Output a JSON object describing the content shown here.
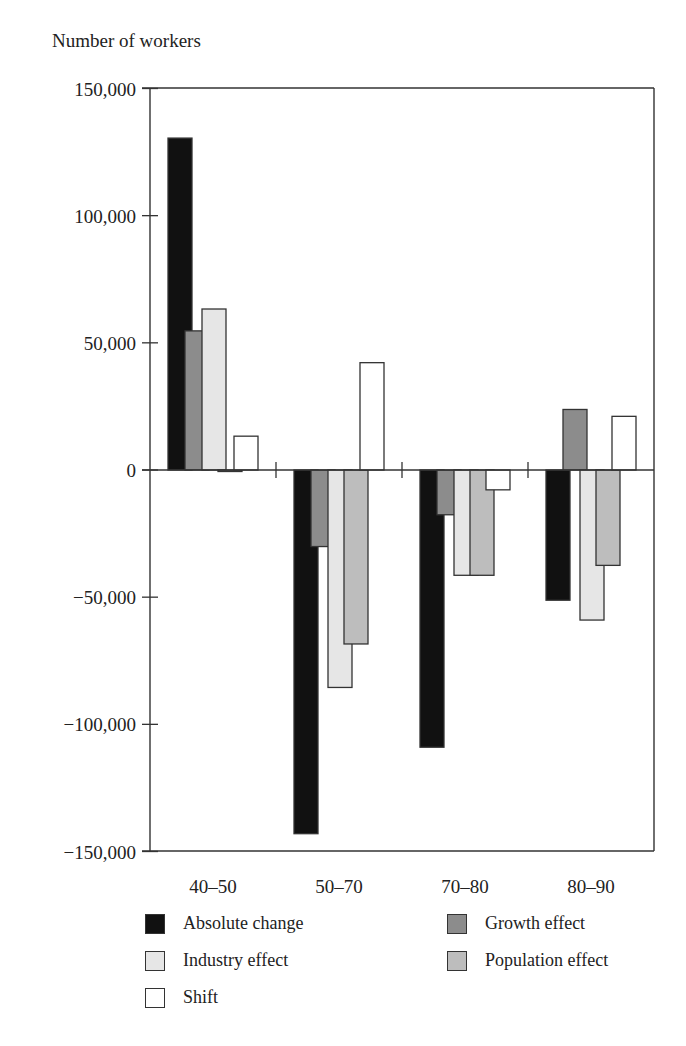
{
  "chart_data": {
    "type": "bar",
    "title": "",
    "ylabel": "Number of workers",
    "xlabel": "",
    "categories": [
      "40–50",
      "50–70",
      "70–80",
      "80–90"
    ],
    "ylim": [
      -150000,
      150000
    ],
    "yticks": [
      150000,
      100000,
      50000,
      0,
      -50000,
      -100000,
      -150000
    ],
    "ytick_labels": [
      "150,000",
      "100,000",
      "50,000",
      "0",
      "−50,000",
      "−100,000",
      "−150,000"
    ],
    "grid": false,
    "legend_position": "bottom",
    "series": [
      {
        "name": "Absolute change",
        "color": "#111111",
        "values": [
          130500,
          -143000,
          -109000,
          -51200
        ]
      },
      {
        "name": "Growth effect",
        "color": "#8c8c8c",
        "values": [
          54700,
          -30100,
          -17600,
          23800
        ]
      },
      {
        "name": "Industry effect",
        "color": "#e6e6e6",
        "values": [
          63300,
          -85500,
          -41400,
          -59000
        ]
      },
      {
        "name": "Population effect",
        "color": "#bdbdbd",
        "values": [
          -500,
          -68400,
          -41400,
          -37500
        ]
      },
      {
        "name": "Shift",
        "color": "#ffffff",
        "values": [
          13300,
          42200,
          -7800,
          21100
        ]
      }
    ]
  },
  "legend": {
    "items": [
      {
        "label": "Absolute change",
        "color": "#111111"
      },
      {
        "label": "Growth effect",
        "color": "#8c8c8c"
      },
      {
        "label": "Industry effect",
        "color": "#e6e6e6"
      },
      {
        "label": "Population effect",
        "color": "#bdbdbd"
      },
      {
        "label": "Shift",
        "color": "#ffffff"
      }
    ]
  }
}
